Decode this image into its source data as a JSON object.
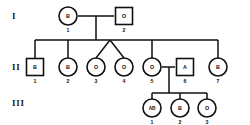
{
  "diagram": {
    "kind": "pedigree-chart",
    "topic": "ABO blood group inheritance pedigree",
    "line_color": "#111111",
    "symbol_fill": "#ffffff",
    "background": "#ffffff"
  },
  "generation_labels": [
    {
      "id": "gen-I",
      "text": "I",
      "x": 12,
      "y": 19
    },
    {
      "id": "gen-II",
      "text": "II",
      "x": 12,
      "y": 70
    },
    {
      "id": "gen-III",
      "text": "III",
      "x": 12,
      "y": 106
    }
  ],
  "individuals": [
    {
      "id": "I-1",
      "generation": "I",
      "number": "1",
      "sex": "female",
      "shape": "circle",
      "blood_type": "B",
      "x": 68,
      "y": 16
    },
    {
      "id": "I-2",
      "generation": "I",
      "number": "2",
      "sex": "male",
      "shape": "square",
      "blood_type": "O",
      "x": 124,
      "y": 16
    },
    {
      "id": "II-1",
      "generation": "II",
      "number": "1",
      "sex": "male",
      "shape": "square",
      "blood_type": "B",
      "x": 35,
      "y": 67
    },
    {
      "id": "II-2",
      "generation": "II",
      "number": "2",
      "sex": "female",
      "shape": "circle",
      "blood_type": "B",
      "x": 68,
      "y": 67
    },
    {
      "id": "II-3",
      "generation": "II",
      "number": "3",
      "sex": "female",
      "shape": "circle",
      "blood_type": "O",
      "x": 96,
      "y": 67
    },
    {
      "id": "II-4",
      "generation": "II",
      "number": "4",
      "sex": "female",
      "shape": "circle",
      "blood_type": "O",
      "x": 124,
      "y": 67
    },
    {
      "id": "II-5",
      "generation": "II",
      "number": "5",
      "sex": "female",
      "shape": "circle",
      "blood_type": "O",
      "x": 152,
      "y": 67
    },
    {
      "id": "II-6",
      "generation": "II",
      "number": "6",
      "sex": "male",
      "shape": "square",
      "blood_type": "A",
      "x": 185,
      "y": 67
    },
    {
      "id": "II-7",
      "generation": "II",
      "number": "7",
      "sex": "female",
      "shape": "circle",
      "blood_type": "B",
      "x": 218,
      "y": 67
    },
    {
      "id": "III-1",
      "generation": "III",
      "number": "1",
      "sex": "female",
      "shape": "circle",
      "blood_type": "AB",
      "x": 152,
      "y": 108
    },
    {
      "id": "III-2",
      "generation": "III",
      "number": "2",
      "sex": "female",
      "shape": "circle",
      "blood_type": "B",
      "x": 180,
      "y": 108
    },
    {
      "id": "III-3",
      "generation": "III",
      "number": "3",
      "sex": "female",
      "shape": "circle",
      "blood_type": "O",
      "x": 207,
      "y": 108
    }
  ],
  "matings": [
    {
      "id": "mating-I",
      "partners": [
        "I-1",
        "I-2"
      ],
      "offspring": [
        "II-1",
        "II-2",
        "II-3",
        "II-4",
        "II-5",
        "II-7"
      ]
    },
    {
      "id": "mating-II",
      "partners": [
        "II-5",
        "II-6"
      ],
      "offspring": [
        "III-1",
        "III-2",
        "III-3"
      ]
    }
  ],
  "twins": {
    "pair": [
      "II-3",
      "II-4"
    ],
    "apex_x": 110,
    "apex_y": 47
  }
}
